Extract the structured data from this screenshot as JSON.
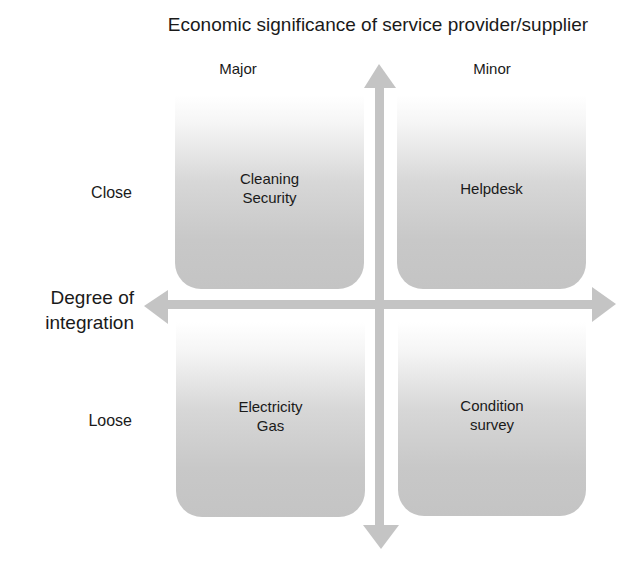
{
  "diagram": {
    "title": "Economic significance of service provider/supplier",
    "columns": [
      {
        "label": "Major"
      },
      {
        "label": "Minor"
      }
    ],
    "rows": [
      {
        "label": "Close"
      },
      {
        "label": "Loose"
      }
    ],
    "vertical_axis_label": {
      "line1": "Degree of",
      "line2": "integration"
    },
    "quadrants": {
      "close_major": {
        "line1": "Cleaning",
        "line2": "Security"
      },
      "close_minor": {
        "line1": "Helpdesk",
        "line2": ""
      },
      "loose_major": {
        "line1": "Electricity",
        "line2": "Gas"
      },
      "loose_minor": {
        "line1": "Condition",
        "line2": "survey"
      }
    },
    "colors": {
      "arrow": "#c4c4c4",
      "box_bottom": "#c4c4c4",
      "box_top": "#ffffff",
      "text": "#1a1a1a"
    }
  }
}
